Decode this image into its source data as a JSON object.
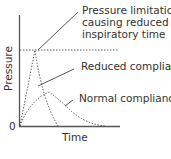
{
  "diagram": {
    "axis_labels": {
      "y": "Pressure",
      "x": "Time",
      "origin": "0"
    },
    "annotations": [
      {
        "id": "pressure-limit",
        "lines": [
          "Pressure limitation",
          "causing reduced",
          "inspiratory  time"
        ]
      },
      {
        "id": "reduced-compliance",
        "lines": [
          "Reduced compliance"
        ]
      },
      {
        "id": "normal-compliance",
        "lines": [
          "Normal compliance"
        ]
      }
    ],
    "colors": {
      "line": "#444444",
      "axis": "#555555",
      "text": "#333333",
      "background": "#ffffff"
    }
  }
}
